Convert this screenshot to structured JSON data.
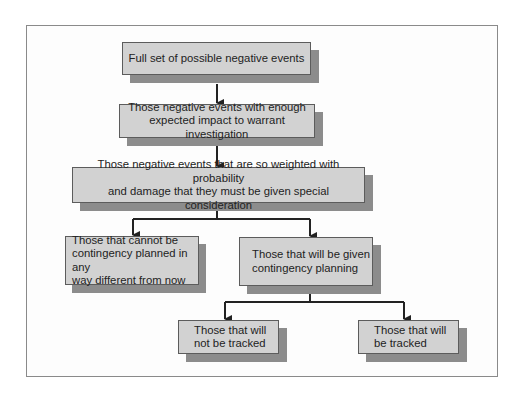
{
  "diagram": {
    "type": "flowchart",
    "nodes": [
      {
        "id": "n1",
        "label": "Full set of possible negative events"
      },
      {
        "id": "n2",
        "label": "Those negative events with enough\nexpected impact to warrant  investigation"
      },
      {
        "id": "n3",
        "label": "Those negative events that are so weighted with probability\nand damage that they must be given special consideration"
      },
      {
        "id": "n4",
        "label": "Those that cannot be\ncontingency planned in any\nway different from now"
      },
      {
        "id": "n5",
        "label": "Those that will be given\ncontingency planning"
      },
      {
        "id": "n6",
        "label": "Those that will\nnot be tracked"
      },
      {
        "id": "n7",
        "label": "Those that will\nbe tracked"
      }
    ],
    "edges": [
      {
        "from": "n1",
        "to": "n2"
      },
      {
        "from": "n2",
        "to": "n3"
      },
      {
        "from": "n3",
        "to": "n4"
      },
      {
        "from": "n3",
        "to": "n5"
      },
      {
        "from": "n5",
        "to": "n6"
      },
      {
        "from": "n5",
        "to": "n7"
      }
    ],
    "colors": {
      "box_fill": "#d2d2d2",
      "box_border": "#5c5c5c",
      "shadow": "#8c8c8c",
      "arrow": "#222222"
    }
  }
}
